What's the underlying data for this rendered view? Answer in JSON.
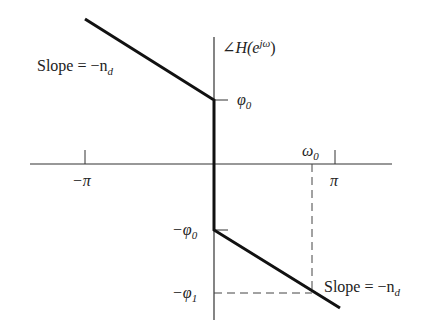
{
  "diagram": {
    "y_axis_label": {
      "prefix": "∠H(e",
      "sup": "jω",
      "suffix": ")"
    },
    "x_ticks": {
      "neg_pi": "−π",
      "pi": "π",
      "omega0": "ω",
      "omega0_sub": "0"
    },
    "y_ticks": {
      "phi0": {
        "sym": "φ",
        "sub": "0"
      },
      "neg_phi0": {
        "sym": "−φ",
        "sub": "0"
      },
      "neg_phi1": {
        "sym": "−φ",
        "sub": "1"
      }
    },
    "slope_left": {
      "text": "Slope = −n",
      "sub": "d"
    },
    "slope_right": {
      "text": "Slope = −n",
      "sub": "d"
    },
    "colors": {
      "line": "#111111",
      "axis": "#333333",
      "dash": "#444444"
    }
  }
}
